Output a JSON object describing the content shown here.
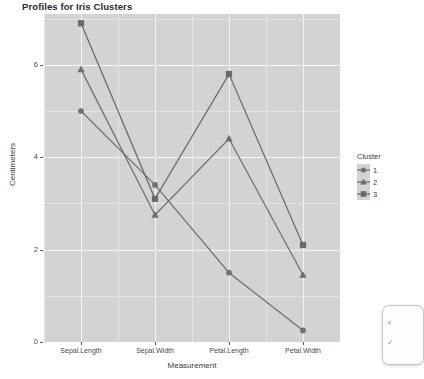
{
  "chart": {
    "title": "Profiles for Iris Clusters",
    "xlabel": "Measurement",
    "ylabel": "Centimeters",
    "legend_title": "Cluster"
  },
  "axes": {
    "y_ticks": [
      "0",
      "2",
      "4",
      "6"
    ],
    "x_ticks": [
      "Sepal.Length",
      "Sepal.Width",
      "Petal.Length",
      "Petal.Width"
    ]
  },
  "legend": {
    "title": "Cluster",
    "items": [
      {
        "label": "1",
        "marker": "circle-marker",
        "color": "#707070"
      },
      {
        "label": "2",
        "marker": "triangle-marker",
        "color": "#6e6e6e"
      },
      {
        "label": "3",
        "marker": "square-marker",
        "color": "#6a6a6a"
      }
    ]
  },
  "overlay": {
    "line1": "×",
    "line2": "✓"
  },
  "chart_data": {
    "type": "line",
    "title": "Profiles for Iris Clusters",
    "xlabel": "Measurement",
    "ylabel": "Centimeters",
    "categories": [
      "Sepal.Length",
      "Sepal.Width",
      "Petal.Length",
      "Petal.Width"
    ],
    "ylim": [
      0,
      7.1
    ],
    "y_ticks": [
      0,
      2,
      4,
      6
    ],
    "grid": true,
    "legend_position": "right",
    "series": [
      {
        "name": "1",
        "marker": "circle",
        "color": "#707070",
        "values": [
          5.0,
          3.4,
          1.5,
          0.25
        ]
      },
      {
        "name": "2",
        "marker": "triangle",
        "color": "#6e6e6e",
        "values": [
          5.9,
          2.75,
          4.4,
          1.45
        ]
      },
      {
        "name": "3",
        "marker": "square",
        "color": "#6a6a6a",
        "values": [
          6.9,
          3.1,
          5.8,
          2.1
        ]
      }
    ]
  }
}
